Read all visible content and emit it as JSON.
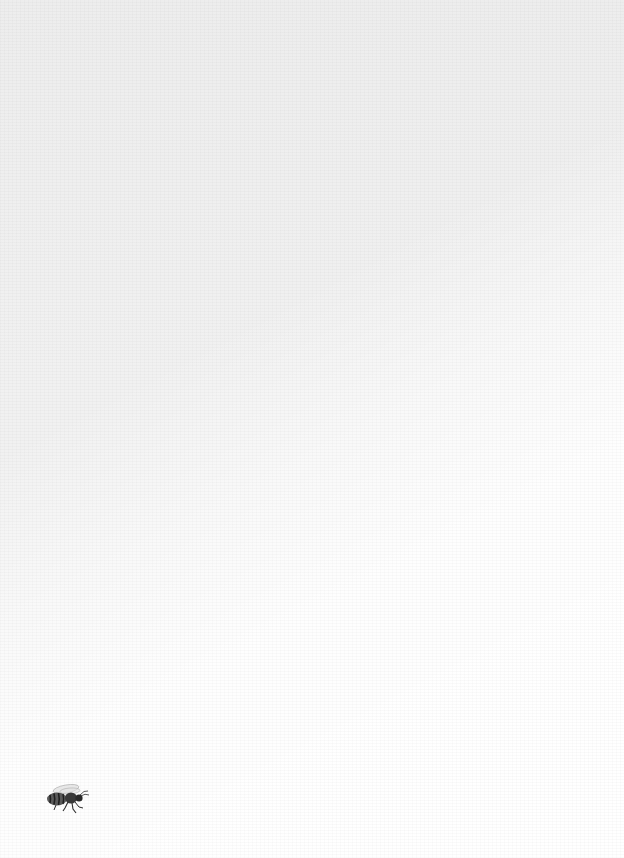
{
  "page": {
    "background_color": "#f1f1f1",
    "highlight_color": "#ffffff",
    "texture": "linen-paper"
  },
  "illustration": {
    "icon": "bee-icon",
    "description": "Monochrome engraving-style honeybee, side view, facing right",
    "color": "#333333"
  }
}
